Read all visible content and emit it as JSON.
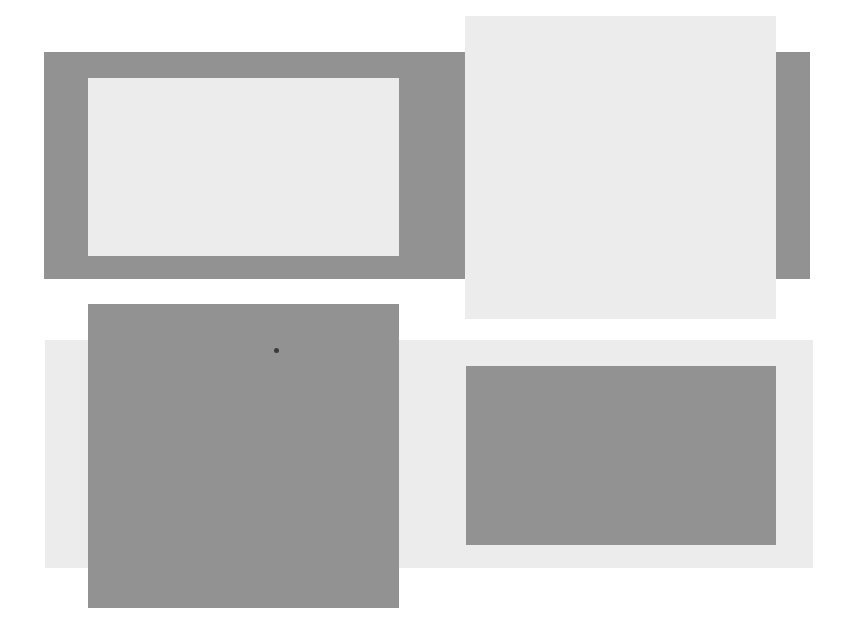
{
  "figure": {
    "colors": {
      "dark": "#929292",
      "light": "#ececec",
      "background": "#ffffff",
      "dot": "#3a3a3a"
    },
    "panels": [
      {
        "id": "top-left",
        "outer": "dark",
        "inner": "light",
        "inner_shape": "landscape rectangle"
      },
      {
        "id": "top-right",
        "outer": "dark",
        "inner": "light",
        "inner_shape": "large square overlapping frame"
      },
      {
        "id": "bottom-left",
        "outer": "light",
        "inner": "dark",
        "inner_shape": "large square overlapping frame",
        "marker": "dot"
      },
      {
        "id": "bottom-right",
        "outer": "light",
        "inner": "dark",
        "inner_shape": "landscape rectangle"
      }
    ]
  }
}
